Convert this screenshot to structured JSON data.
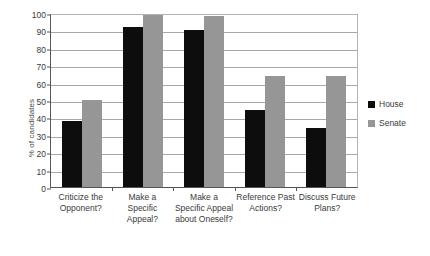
{
  "chart_data": {
    "type": "bar",
    "title": "",
    "xlabel": "",
    "ylabel": "% of candidates",
    "ylim": [
      0,
      100
    ],
    "yticks": [
      0,
      10,
      20,
      30,
      40,
      50,
      60,
      70,
      80,
      90,
      100
    ],
    "grid": true,
    "legend_position": "right",
    "categories": [
      "Criticize the Opponent?",
      "Make a Specific Appeal?",
      "Make a Specific Appeal about Oneself?",
      "Reference Past Actions?",
      "Discuss Future Plans?"
    ],
    "series": [
      {
        "name": "House",
        "color": "#0d0d0d",
        "values": [
          38,
          92,
          90,
          44,
          34
        ]
      },
      {
        "name": "Senate",
        "color": "#969696",
        "values": [
          50,
          99,
          98,
          64,
          64
        ]
      }
    ]
  },
  "axis": {
    "y_title": "% of candidates",
    "tick_0": "0",
    "tick_10": "10",
    "tick_20": "20",
    "tick_30": "30",
    "tick_40": "40",
    "tick_50": "50",
    "tick_60": "60",
    "tick_70": "70",
    "tick_80": "80",
    "tick_90": "90",
    "tick_100": "100"
  },
  "xlabels": {
    "cat_0": "Criticize the Opponent?",
    "cat_1": "Make a Specific Appeal?",
    "cat_2": "Make a Specific Appeal about Oneself?",
    "cat_3": "Reference Past Actions?",
    "cat_4": "Discuss Future Plans?"
  },
  "legend": {
    "house": "House",
    "senate": "Senate"
  }
}
